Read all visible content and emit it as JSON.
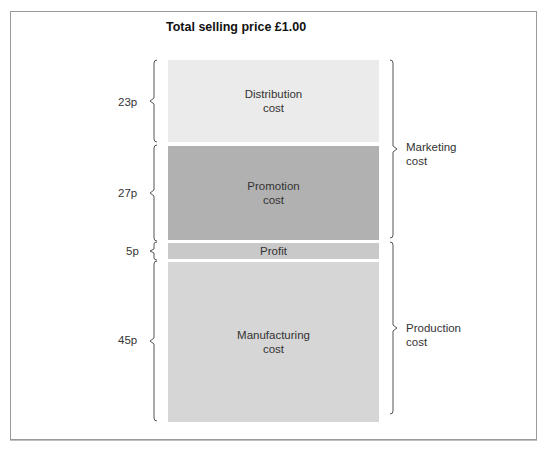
{
  "title": "Total selling price £1.00",
  "blocks": [
    {
      "name": "distribution",
      "label_line1": "Distribution",
      "label_line2": "cost",
      "amount": "23p",
      "value": 23,
      "color": "#ebebeb"
    },
    {
      "name": "promotion",
      "label_line1": "Promotion",
      "label_line2": "cost",
      "amount": "27p",
      "value": 27,
      "color": "#b1b1b1"
    },
    {
      "name": "profit",
      "label_line1": "Profit",
      "label_line2": "",
      "amount": "5p",
      "value": 5,
      "color": "#c9c9c9"
    },
    {
      "name": "manufacturing",
      "label_line1": "Manufacturing",
      "label_line2": "cost",
      "amount": "45p",
      "value": 45,
      "color": "#d6d6d6"
    }
  ],
  "groups": [
    {
      "name": "marketing",
      "line1": "Marketing",
      "line2": "cost"
    },
    {
      "name": "production",
      "line1": "Production",
      "line2": "cost"
    }
  ]
}
